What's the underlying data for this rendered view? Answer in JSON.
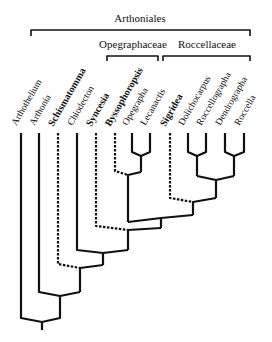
{
  "diagram": {
    "type": "phylogenetic-tree",
    "order": "Arthoniales",
    "families": [
      {
        "name": "Opegraphaceae",
        "x1": 107,
        "x2": 158
      },
      {
        "name": "Roccellaceae",
        "x1": 163,
        "x2": 250
      }
    ],
    "order_bracket": {
      "x1": 31,
      "x2": 250
    },
    "taxa": [
      {
        "name": "Arthothelium",
        "x": 21,
        "bold": false,
        "dashed": false
      },
      {
        "name": "Arthonia",
        "x": 39,
        "bold": false,
        "dashed": false
      },
      {
        "name": "Schismatomma",
        "x": 58,
        "bold": true,
        "dashed": true
      },
      {
        "name": "Chiodecton",
        "x": 77,
        "bold": false,
        "dashed": false
      },
      {
        "name": "Syncesia",
        "x": 96,
        "bold": true,
        "dashed": true
      },
      {
        "name": "Byssophoropsis",
        "x": 115,
        "bold": true,
        "dashed": true
      },
      {
        "name": "Opegrapha",
        "x": 132,
        "bold": false,
        "dashed": false
      },
      {
        "name": "Lecanactis",
        "x": 150,
        "bold": false,
        "dashed": false
      },
      {
        "name": "Sigridea",
        "x": 170,
        "bold": true,
        "dashed": true
      },
      {
        "name": "Dolichocarpus",
        "x": 188,
        "bold": false,
        "dashed": false
      },
      {
        "name": "Roccellographa",
        "x": 206,
        "bold": false,
        "dashed": false
      },
      {
        "name": "Dendrographa",
        "x": 225,
        "bold": false,
        "dashed": false
      },
      {
        "name": "Roccella",
        "x": 244,
        "bold": false,
        "dashed": false
      }
    ]
  },
  "labels": {
    "order": "Arthoniales",
    "family_1": "Opegraphaceae",
    "family_2": "Roccellaceae"
  }
}
